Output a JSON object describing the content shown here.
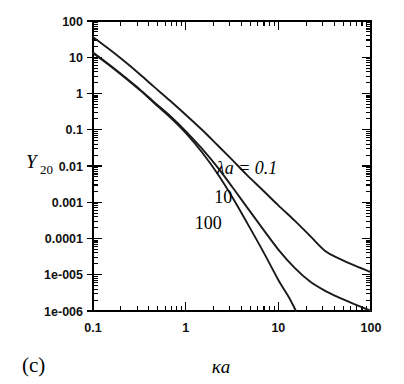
{
  "figure": {
    "panel_label": "(c)",
    "background_color": "#ffffff",
    "line_color": "#1a1a1a"
  },
  "chart_data": {
    "type": "line",
    "title": "",
    "subtitle": "",
    "xlabel": "κa",
    "ylabel": "Y",
    "ylabel_sub": "20",
    "xscale": "log",
    "yscale": "log",
    "xlim": [
      0.1,
      100
    ],
    "ylim": [
      1e-06,
      100
    ],
    "grid": false,
    "legend_position": "inline-curve-labels",
    "xticks": [
      0.1,
      1,
      10,
      100
    ],
    "xtick_labels": [
      "0.1",
      "1",
      "10",
      "100"
    ],
    "yticks": [
      100,
      10,
      1,
      0.1,
      0.01,
      0.001,
      0.0001,
      1e-05,
      1e-06
    ],
    "ytick_labels": [
      "100",
      "10",
      "1",
      "0.1",
      "0.01",
      "0.001",
      "0.0001",
      "1e-005",
      "1e-006"
    ],
    "annotations": [
      {
        "text": "λa = 0.1",
        "x": 4.6,
        "y": 0.0062
      },
      {
        "text": "10",
        "x": 2.55,
        "y": 0.00098
      },
      {
        "text": "100",
        "x": 1.75,
        "y": 0.00018
      }
    ],
    "series": [
      {
        "name": "λa = 0.1",
        "label": "λa = 0.1",
        "x": [
          0.1,
          0.15,
          0.22,
          0.32,
          0.46,
          0.68,
          1.0,
          1.5,
          2.2,
          3.2,
          4.6,
          6.8,
          10.0,
          15.0,
          22.0,
          32.0,
          46.0,
          68.0,
          100.0
        ],
        "y": [
          36.0,
          16.5,
          7.6,
          3.4,
          1.5,
          0.63,
          0.26,
          0.1,
          0.038,
          0.0145,
          0.0056,
          0.00215,
          0.00082,
          0.00031,
          0.000118,
          4.55e-05,
          2.75e-05,
          1.75e-05,
          1.18e-05
        ]
      },
      {
        "name": "λa = 10",
        "label": "10",
        "x": [
          0.1,
          0.15,
          0.22,
          0.32,
          0.46,
          0.68,
          1.0,
          1.5,
          2.2,
          3.2,
          4.6,
          6.8,
          10.0,
          15.0,
          22.0,
          32.0,
          46.0,
          68.0,
          100.0
        ],
        "y": [
          13.5,
          6.2,
          2.85,
          1.3,
          0.57,
          0.24,
          0.092,
          0.03,
          0.0093,
          0.0026,
          0.00072,
          0.000185,
          4.95e-05,
          1.55e-05,
          6.5e-06,
          3.6e-06,
          2.3e-06,
          1.5e-06,
          1e-06
        ]
      },
      {
        "name": "λa = 100",
        "label": "100",
        "x": [
          0.1,
          0.15,
          0.22,
          0.32,
          0.46,
          0.68,
          1.0,
          1.5,
          2.2,
          3.2,
          4.6,
          6.8,
          10.0,
          13.0,
          15.5
        ],
        "y": [
          13.0,
          6.0,
          2.75,
          1.24,
          0.54,
          0.22,
          0.082,
          0.024,
          0.0062,
          0.00135,
          0.00027,
          4.55e-05,
          7.2e-06,
          2.4e-06,
          1e-06
        ]
      }
    ]
  }
}
